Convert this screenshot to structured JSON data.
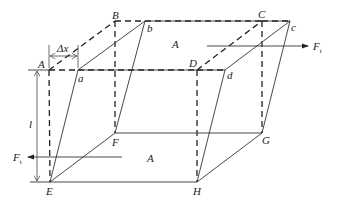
{
  "diagram": {
    "type": "shear-deformation-box",
    "labels": {
      "A": "A",
      "B": "B",
      "C": "C",
      "D": "D",
      "a": "a",
      "b": "b",
      "c": "c",
      "d": "d",
      "E": "E",
      "F": "F",
      "G": "G",
      "H": "H"
    },
    "area_top": "A",
    "area_bottom": "A",
    "delta_x": "Δx",
    "length": "l",
    "force_top": {
      "symbol": "F",
      "subscript": "t",
      "direction": "right"
    },
    "force_bottom": {
      "symbol": "F",
      "subscript": "t",
      "direction": "left"
    },
    "colors": {
      "line": "#333333",
      "background": "#ffffff"
    }
  }
}
